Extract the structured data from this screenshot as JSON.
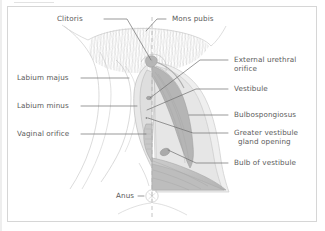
{
  "figure": {
    "type": "anatomical-diagram",
    "orientation": "Left half shows surface anatomy; right half shows deep dissection; vertical dashed midline",
    "background_color": "#ffffff",
    "border_color": "#d6d6d6",
    "label_color": "#5a5a5a",
    "leader_line_color": "#6b6b6b"
  },
  "labels": {
    "clitoris": "Clitoris",
    "mons_pubis": "Mons pubis",
    "labium_majus": "Labium majus",
    "labium_minus": "Labium minus",
    "vaginal_orifice": "Vaginal orifice",
    "anus": "Anus",
    "external_urethral_orifice_line1": "External urethral",
    "external_urethral_orifice_line2": "orifice",
    "vestibule": "Vestibule",
    "bulbospongiosus": "Bulbospongiosus",
    "greater_vestibule_gland_line1": "Greater vestibule",
    "greater_vestibule_gland_line2": "gland opening",
    "bulb_of_vestibule": "Bulb of vestibule"
  },
  "structures": [
    {
      "name": "mons-pubis",
      "description": "Hair-covered mound superior to the cleft"
    },
    {
      "name": "labium-majus",
      "description": "Outer fold of the vulva"
    },
    {
      "name": "labium-minus",
      "description": "Inner fold bounding the vestibule"
    },
    {
      "name": "clitoris",
      "description": "Erectile organ at anterior commissure"
    },
    {
      "name": "vestibule",
      "description": "Cleft between labia minora"
    },
    {
      "name": "external-urethral-orifice",
      "description": "Urethral opening in vestibule"
    },
    {
      "name": "vaginal-orifice",
      "description": "Vaginal opening in vestibule"
    },
    {
      "name": "bulbospongiosus",
      "description": "Muscle overlying bulb of vestibule"
    },
    {
      "name": "bulb-of-vestibule",
      "description": "Paired erectile tissue flanking vagina"
    },
    {
      "name": "greater-vestibule-gland-opening",
      "description": "Bartholin gland duct opening"
    },
    {
      "name": "anus",
      "description": "Anal opening posterior to perineum"
    }
  ]
}
